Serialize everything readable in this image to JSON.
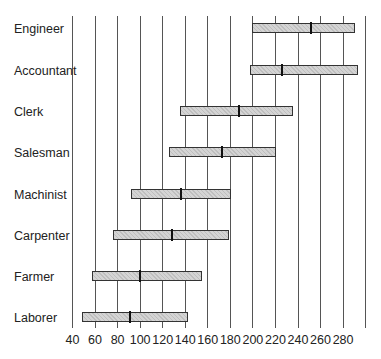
{
  "chart_data": {
    "type": "box-range",
    "title": "",
    "xlabel": "",
    "ylabel": "",
    "xlim": [
      40,
      300
    ],
    "x_ticks": [
      40,
      60,
      80,
      100,
      120,
      140,
      160,
      180,
      200,
      220,
      240,
      260,
      280
    ],
    "gridlines": [
      40,
      60,
      80,
      100,
      120,
      140,
      160,
      180,
      200,
      220,
      240,
      260,
      280,
      300
    ],
    "grid": true,
    "categories": [
      "Engineer",
      "Accountant",
      "Clerk",
      "Salesman",
      "Machinist",
      "Carpenter",
      "Farmer",
      "Laborer"
    ],
    "series": [
      {
        "name": "low",
        "values": [
          200,
          198,
          136,
          126,
          92,
          76,
          58,
          49
        ]
      },
      {
        "name": "median",
        "values": [
          252,
          226,
          188,
          173,
          137,
          129,
          100,
          91
        ]
      },
      {
        "name": "high",
        "values": [
          291,
          294,
          236,
          221,
          181,
          179,
          156,
          143
        ]
      }
    ],
    "colors": {
      "bar_fill": "#d4d4d4",
      "bar_border": "#333333",
      "gridline": "#555555",
      "median": "#111111"
    }
  }
}
